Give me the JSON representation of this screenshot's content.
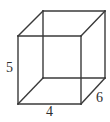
{
  "figure": {
    "name": "rectangular-prism",
    "stroke_color": "#3a3a3a",
    "background_color": "#ffffff",
    "label_color": "#2e2e2e",
    "labels": {
      "height": "5",
      "width": "4",
      "depth": "6"
    },
    "vertices": {
      "front_top_left": [
        18,
        36
      ],
      "front_top_right": [
        81,
        36
      ],
      "front_bottom_right": [
        81,
        104
      ],
      "front_bottom_left": [
        18,
        104
      ],
      "back_top_left": [
        43,
        11
      ],
      "back_top_right": [
        105,
        11
      ],
      "back_bottom_right": [
        105,
        78
      ],
      "back_bottom_left": [
        43,
        78
      ]
    },
    "edges": [
      {
        "name": "front-top",
        "from": "front_top_left",
        "to": "front_top_right"
      },
      {
        "name": "front-right",
        "from": "front_top_right",
        "to": "front_bottom_right"
      },
      {
        "name": "front-bottom",
        "from": "front_bottom_right",
        "to": "front_bottom_left"
      },
      {
        "name": "front-left",
        "from": "front_bottom_left",
        "to": "front_top_left"
      },
      {
        "name": "back-top",
        "from": "back_top_left",
        "to": "back_top_right"
      },
      {
        "name": "back-right",
        "from": "back_top_right",
        "to": "back_bottom_right"
      },
      {
        "name": "back-bottom",
        "from": "back_bottom_right",
        "to": "back_bottom_left"
      },
      {
        "name": "back-left",
        "from": "back_bottom_left",
        "to": "back_top_left"
      },
      {
        "name": "depth-top-left",
        "from": "front_top_left",
        "to": "back_top_left"
      },
      {
        "name": "depth-top-right",
        "from": "front_top_right",
        "to": "back_top_right"
      },
      {
        "name": "depth-bottom-right",
        "from": "front_bottom_right",
        "to": "back_bottom_right"
      },
      {
        "name": "depth-bottom-left",
        "from": "front_bottom_left",
        "to": "back_bottom_left"
      }
    ]
  }
}
